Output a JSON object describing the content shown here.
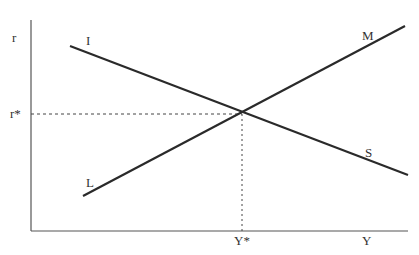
{
  "diagram": {
    "type": "IS-LM",
    "colors": {
      "curve": "#2a2a2a",
      "axis": "#555555",
      "guide": "#444444",
      "text": "#333333"
    },
    "axes": {
      "y_label": "r",
      "x_label": "Y",
      "y_equilibrium_label": "r*",
      "x_equilibrium_label": "Y*"
    },
    "curves": [
      {
        "id": "IS",
        "start_label": "I",
        "end_label": "S"
      },
      {
        "id": "LM",
        "start_label": "L",
        "end_label": "M"
      }
    ]
  }
}
